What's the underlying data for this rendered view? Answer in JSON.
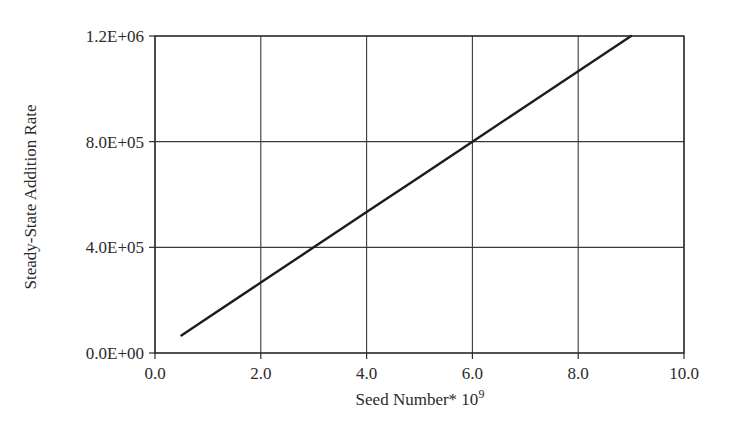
{
  "chart_data": {
    "type": "line",
    "title": "",
    "xlabel": "Seed Number* 10",
    "xlabel_superscript": "9",
    "ylabel": "Steady-State Addition Rate",
    "xlim": [
      0.0,
      10.0
    ],
    "ylim": [
      0,
      1200000
    ],
    "x_ticks": [
      "0.0",
      "2.0",
      "4.0",
      "6.0",
      "8.0",
      "10.0"
    ],
    "y_ticks": [
      "0.0E+00",
      "4.0E+05",
      "8.0E+05",
      "1.2E+06"
    ],
    "grid": true,
    "legend": null,
    "series": [
      {
        "name": "Steady-State Addition Rate",
        "color": "#1c1c1c",
        "x": [
          0.5,
          1.0,
          2.0,
          3.0,
          4.0,
          5.0,
          6.0,
          7.0,
          8.0,
          9.0
        ],
        "y": [
          66667,
          133333,
          266667,
          400000,
          533333,
          666667,
          800000,
          933333,
          1066667,
          1200000
        ]
      }
    ]
  }
}
